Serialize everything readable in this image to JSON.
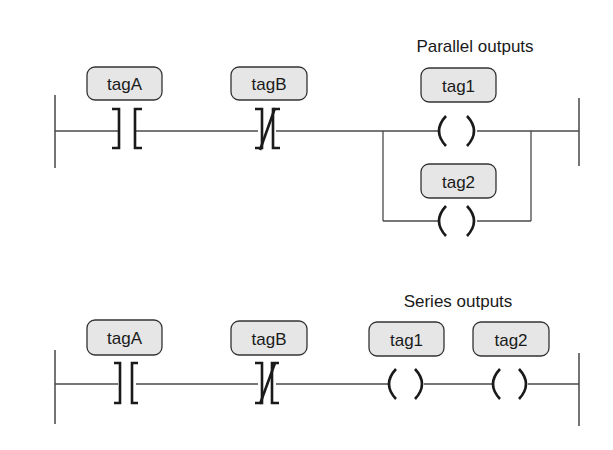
{
  "diagram": {
    "type": "ladder-logic",
    "colors": {
      "line": "#4a4a4a",
      "tag_fill": "#e6e6e6",
      "tag_border": "#333333",
      "text": "#1a1a1a"
    },
    "rung1": {
      "title": "Parallel outputs",
      "contacts": [
        {
          "tag": "tagA",
          "kind": "normally-open"
        },
        {
          "tag": "tagB",
          "kind": "normally-closed"
        }
      ],
      "coils": [
        {
          "tag": "tag1",
          "branch": "top"
        },
        {
          "tag": "tag2",
          "branch": "bottom"
        }
      ]
    },
    "rung2": {
      "title": "Series outputs",
      "contacts": [
        {
          "tag": "tagA",
          "kind": "normally-open"
        },
        {
          "tag": "tagB",
          "kind": "normally-closed"
        }
      ],
      "coils": [
        {
          "tag": "tag1"
        },
        {
          "tag": "tag2"
        }
      ]
    }
  }
}
